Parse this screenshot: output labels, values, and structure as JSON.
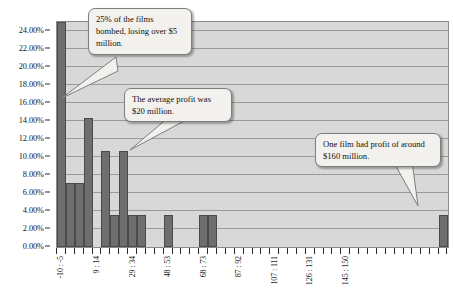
{
  "chart_data": {
    "type": "bar",
    "title": "",
    "subtitle": "",
    "xlabel": "",
    "ylabel": "",
    "ylim": [
      0,
      25
    ],
    "y_ticks": [
      0,
      2,
      4,
      6,
      8,
      10,
      12,
      14,
      16,
      18,
      20,
      22,
      24
    ],
    "y_tick_labels": [
      "0.00%",
      "2.00%",
      "4.00%",
      "6.00%",
      "8.00%",
      "10.00%",
      "12.00%",
      "14.00%",
      "16.00%",
      "18.00%",
      "20.00%",
      "22.00%",
      "24.00%"
    ],
    "grid": true,
    "legend": null,
    "bin_count": 44,
    "x_tick_count": 44,
    "x_tick_labels_sparse": [
      {
        "bin_index": 0,
        "label": "-10 : -5"
      },
      {
        "bin_index": 4,
        "label": "9 : 14"
      },
      {
        "bin_index": 8,
        "label": "29 : 34"
      },
      {
        "bin_index": 12,
        "label": "48 : 53"
      },
      {
        "bin_index": 16,
        "label": "68 : 73"
      },
      {
        "bin_index": 20,
        "label": "87 : 92"
      },
      {
        "bin_index": 24,
        "label": "107 : 111"
      },
      {
        "bin_index": 28,
        "label": "126 : 131"
      },
      {
        "bin_index": 32,
        "label": "145 : 150"
      }
    ],
    "categories": [
      "-10 : -5",
      "-5 : 0",
      "0 : 4",
      "4 : 9",
      "9 : 14",
      "14 : 19",
      "19 : 24",
      "24 : 29",
      "29 : 34",
      "34 : 38",
      "38 : 43",
      "43 : 48",
      "48 : 53",
      "53 : 58",
      "58 : 63",
      "63 : 68",
      "68 : 73",
      "73 : 77",
      "77 : 82",
      "82 : 87",
      "87 : 92",
      "92 : 97",
      "97 : 102",
      "102 : 107",
      "107 : 111",
      "111 : 116",
      "116 : 121",
      "121 : 126",
      "126 : 131",
      "131 : 136",
      "136 : 140",
      "140 : 145",
      "145 : 150",
      "150 : 155",
      "155 : 160",
      "160 : 165",
      "165 : 170",
      "170 : 174",
      "174 : 179",
      "179 : 184",
      "184 : 189",
      "189 : 194",
      "194 : 199",
      "199 : 204"
    ],
    "values": [
      25.0,
      7.1,
      7.1,
      14.3,
      0.0,
      10.7,
      3.6,
      10.7,
      3.6,
      3.6,
      0.0,
      0.0,
      3.6,
      0.0,
      0.0,
      0.0,
      3.6,
      3.6,
      0.0,
      0.0,
      0.0,
      0.0,
      0.0,
      0.0,
      0.0,
      0.0,
      0.0,
      0.0,
      0.0,
      0.0,
      0.0,
      0.0,
      0.0,
      0.0,
      0.0,
      0.0,
      0.0,
      0.0,
      0.0,
      0.0,
      0.0,
      0.0,
      0.0,
      3.6
    ],
    "bar_color": "#6e6e6e",
    "plot_background": "#d8d8d8",
    "gridline_color": "#9a9a9a"
  },
  "annotations": [
    {
      "id": "callout-1",
      "text": "25% of the films bombed, losing over $5 million."
    },
    {
      "id": "callout-2",
      "text": "The average profit was $20 million."
    },
    {
      "id": "callout-3",
      "text": "One film had profit of around $160 million."
    }
  ]
}
